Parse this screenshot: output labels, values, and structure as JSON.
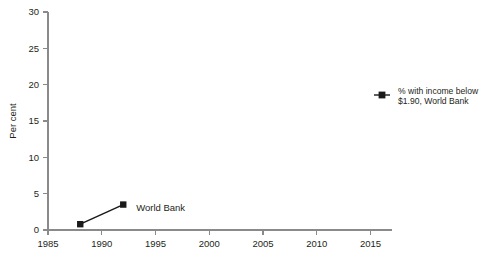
{
  "chart_data": {
    "type": "line",
    "title": "",
    "subtitle": "",
    "xlabel": "",
    "ylabel": "Per cent",
    "xlim": [
      1985,
      2017
    ],
    "ylim": [
      0,
      30
    ],
    "xticks": [
      1985,
      1990,
      1995,
      2000,
      2005,
      2010,
      2015
    ],
    "xticklabels": [
      "1985",
      "1990",
      "1995",
      "2000",
      "2005",
      "2010",
      "2015"
    ],
    "yticks": [
      0,
      5,
      10,
      15,
      20,
      25,
      30
    ],
    "yticklabels": [
      "0",
      "5",
      "10",
      "15",
      "20",
      "25",
      "30"
    ],
    "grid": false,
    "legend_position": "right",
    "series": [
      {
        "name": "% with income below $1.90, World Bank",
        "annotation": "World Bank",
        "color": "#1a1a1a",
        "marker": "square",
        "x": [
          1988,
          1992
        ],
        "values": [
          0.8,
          3.5
        ]
      }
    ],
    "annotations": [
      {
        "text": "World Bank",
        "x": 1993.2,
        "y": 2.6
      }
    ]
  },
  "legend": {
    "items": [
      {
        "line1": "% with income below",
        "line2": "$1.90, World Bank",
        "marker": "square",
        "color": "#1a1a1a"
      }
    ]
  },
  "colors": {
    "axis": "#8a8a8a",
    "text": "#231f20",
    "series": "#1a1a1a",
    "background": "#ffffff"
  }
}
